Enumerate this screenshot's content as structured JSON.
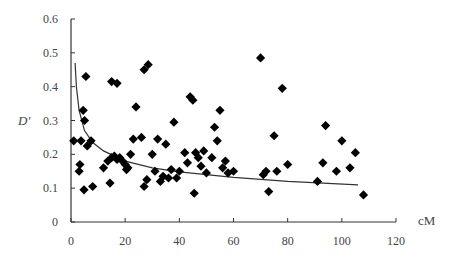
{
  "chart_data": {
    "type": "scatter",
    "title": "",
    "xlabel": "cM",
    "ylabel": "D'",
    "xlim": [
      0,
      120
    ],
    "ylim": [
      0,
      0.6
    ],
    "x_ticks": [
      "0",
      "20",
      "40",
      "60",
      "80",
      "100",
      "120"
    ],
    "y_ticks": [
      "0",
      "0.1",
      "0.2",
      "0.3",
      "0.4",
      "0.5",
      "0.6"
    ],
    "grid": false,
    "legend": null,
    "series": [
      {
        "name": "D' values",
        "marker": "diamond",
        "color": "#000000",
        "points": [
          [
            5.5,
            0.43
          ],
          [
            15,
            0.415
          ],
          [
            17,
            0.41
          ],
          [
            27,
            0.45
          ],
          [
            28.5,
            0.465
          ],
          [
            4.5,
            0.33
          ],
          [
            5,
            0.3
          ],
          [
            1,
            0.24
          ],
          [
            3.7,
            0.24
          ],
          [
            6,
            0.225
          ],
          [
            7.4,
            0.24
          ],
          [
            3.3,
            0.17
          ],
          [
            3,
            0.15
          ],
          [
            4.8,
            0.095
          ],
          [
            8,
            0.105
          ],
          [
            14.4,
            0.115
          ],
          [
            12,
            0.16
          ],
          [
            13.6,
            0.18
          ],
          [
            15,
            0.19
          ],
          [
            16,
            0.195
          ],
          [
            17,
            0.185
          ],
          [
            18,
            0.19
          ],
          [
            19,
            0.18
          ],
          [
            20,
            0.17
          ],
          [
            20.5,
            0.155
          ],
          [
            21,
            0.16
          ],
          [
            22,
            0.2
          ],
          [
            23,
            0.245
          ],
          [
            24,
            0.34
          ],
          [
            26,
            0.25
          ],
          [
            27,
            0.105
          ],
          [
            28,
            0.125
          ],
          [
            30,
            0.2
          ],
          [
            31,
            0.15
          ],
          [
            32,
            0.245
          ],
          [
            33,
            0.12
          ],
          [
            34,
            0.135
          ],
          [
            35,
            0.23
          ],
          [
            36,
            0.13
          ],
          [
            37,
            0.155
          ],
          [
            38,
            0.295
          ],
          [
            39,
            0.13
          ],
          [
            40,
            0.15
          ],
          [
            42,
            0.205
          ],
          [
            43,
            0.175
          ],
          [
            44,
            0.37
          ],
          [
            45,
            0.36
          ],
          [
            45.5,
            0.085
          ],
          [
            46,
            0.205
          ],
          [
            47,
            0.19
          ],
          [
            48,
            0.165
          ],
          [
            49,
            0.21
          ],
          [
            50,
            0.145
          ],
          [
            52,
            0.19
          ],
          [
            53,
            0.28
          ],
          [
            54,
            0.24
          ],
          [
            55,
            0.33
          ],
          [
            56,
            0.16
          ],
          [
            57,
            0.18
          ],
          [
            58,
            0.145
          ],
          [
            60,
            0.15
          ],
          [
            70,
            0.485
          ],
          [
            71,
            0.14
          ],
          [
            72,
            0.15
          ],
          [
            73,
            0.09
          ],
          [
            75,
            0.255
          ],
          [
            76,
            0.15
          ],
          [
            78,
            0.395
          ],
          [
            80,
            0.17
          ],
          [
            91,
            0.12
          ],
          [
            93,
            0.175
          ],
          [
            94,
            0.285
          ],
          [
            98,
            0.15
          ],
          [
            100,
            0.24
          ],
          [
            103,
            0.16
          ],
          [
            105,
            0.205
          ],
          [
            108,
            0.08
          ]
        ]
      },
      {
        "name": "fitted curve",
        "type": "line",
        "color": "#333333",
        "points": [
          [
            1.5,
            0.47
          ],
          [
            2,
            0.4
          ],
          [
            3,
            0.33
          ],
          [
            5,
            0.27
          ],
          [
            8,
            0.235
          ],
          [
            12,
            0.21
          ],
          [
            20,
            0.18
          ],
          [
            30,
            0.16
          ],
          [
            40,
            0.148
          ],
          [
            60,
            0.132
          ],
          [
            80,
            0.12
          ],
          [
            106,
            0.11
          ]
        ]
      }
    ]
  }
}
